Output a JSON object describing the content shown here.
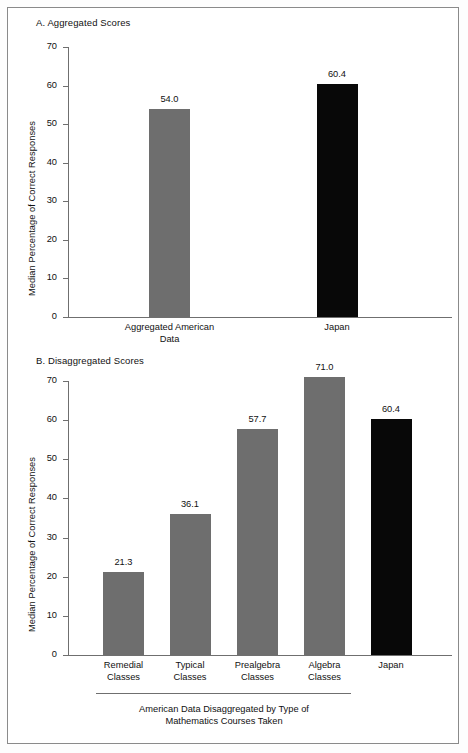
{
  "figure": {
    "panels": [
      {
        "key": "A",
        "title": "A. Aggregated Scores",
        "ylabel": "Median Percentage of Correct Responses"
      },
      {
        "key": "B",
        "title": "B. Disaggregated Scores",
        "ylabel": "Median Percentage of Correct Responses",
        "group_caption_line1": "American Data Disaggregated by Type of",
        "group_caption_line2": "Mathematics Courses Taken"
      }
    ]
  },
  "chart_data": [
    {
      "type": "bar",
      "title": "A. Aggregated Scores",
      "xlabel": "",
      "ylabel": "Median Percentage of Correct Responses",
      "ylim": [
        0,
        70
      ],
      "yticks": [
        0,
        10,
        20,
        30,
        40,
        50,
        60,
        70
      ],
      "grid": false,
      "legend": "none",
      "categories": [
        "Aggregated American Data",
        "Japan"
      ],
      "category_lines": [
        [
          "Aggregated American",
          "Data"
        ],
        [
          "Japan"
        ]
      ],
      "values": [
        54.0,
        60.4
      ],
      "value_labels": [
        "54.0",
        "60.4"
      ],
      "colors": [
        "#6e6e6e",
        "#080808"
      ]
    },
    {
      "type": "bar",
      "title": "B. Disaggregated Scores",
      "xlabel": "American Data Disaggregated by Type of Mathematics Courses Taken",
      "ylabel": "Median Percentage of Correct Responses",
      "ylim": [
        0,
        70
      ],
      "yticks": [
        0,
        10,
        20,
        30,
        40,
        50,
        60,
        70
      ],
      "grid": false,
      "legend": "none",
      "categories": [
        "Remedial Classes",
        "Typical Classes",
        "Prealgebra Classes",
        "Algebra Classes",
        "Japan"
      ],
      "category_lines": [
        [
          "Remedial",
          "Classes"
        ],
        [
          "Typical",
          "Classes"
        ],
        [
          "Prealgebra",
          "Classes"
        ],
        [
          "Algebra",
          "Classes"
        ],
        [
          "Japan"
        ]
      ],
      "values": [
        21.3,
        36.1,
        57.7,
        71.0,
        60.4
      ],
      "value_labels": [
        "21.3",
        "36.1",
        "57.7",
        "71.0",
        "60.4"
      ],
      "colors": [
        "#6e6e6e",
        "#6e6e6e",
        "#6e6e6e",
        "#6e6e6e",
        "#080808"
      ]
    }
  ]
}
